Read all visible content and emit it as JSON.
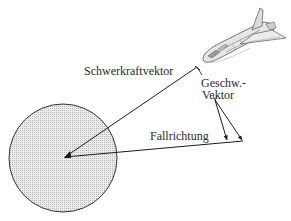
{
  "diagram": {
    "labels": {
      "gravity_vector": "Schwerkraftvektor",
      "velocity_vector_line1": "Geschw.-",
      "velocity_vector_line2": "Vektor",
      "fall_direction": "Fallrichtung"
    },
    "elements": {
      "planet": "planet-circle",
      "spacecraft": "space-shuttle-icon"
    },
    "colors": {
      "stroke": "#1a1a1a",
      "planet_fill": "#d9d9d9",
      "background": "#ffffff"
    }
  }
}
